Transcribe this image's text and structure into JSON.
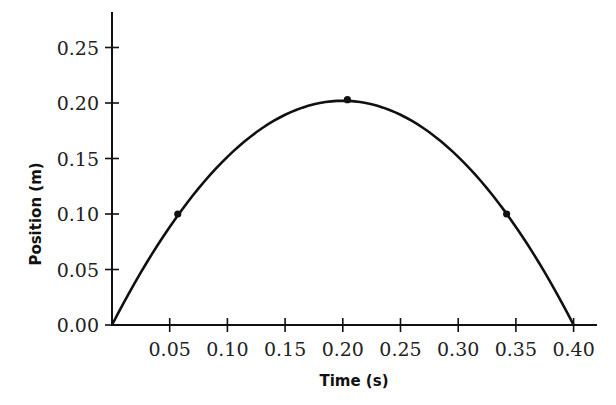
{
  "chart_data": {
    "type": "line",
    "title": "",
    "xlabel": "Time (s)",
    "ylabel": "Position (m)",
    "xlim": [
      0,
      0.42
    ],
    "ylim": [
      0,
      0.28
    ],
    "grid": false,
    "legend": null,
    "x_ticks": [
      "0.05",
      "0.10",
      "0.15",
      "0.20",
      "0.25",
      "0.30",
      "0.35",
      "0.40"
    ],
    "y_ticks": [
      "0.00",
      "0.05",
      "0.10",
      "0.15",
      "0.20",
      "0.25"
    ],
    "series": [
      {
        "name": "position",
        "description": "Parabolic trajectory from (0,0) peaking near (0.20, 0.20) and returning to 0 at t=0.40",
        "x": [
          0,
          0.02,
          0.04,
          0.06,
          0.08,
          0.1,
          0.12,
          0.14,
          0.16,
          0.18,
          0.2,
          0.22,
          0.24,
          0.26,
          0.28,
          0.3,
          0.32,
          0.34,
          0.36,
          0.38,
          0.4
        ],
        "y": [
          0,
          0.039,
          0.073,
          0.102,
          0.13,
          0.152,
          0.171,
          0.185,
          0.195,
          0.2,
          0.202,
          0.2,
          0.195,
          0.185,
          0.171,
          0.152,
          0.13,
          0.102,
          0.073,
          0.039,
          0
        ]
      }
    ],
    "marked_points": [
      {
        "x": 0.057,
        "y": 0.1
      },
      {
        "x": 0.204,
        "y": 0.203
      },
      {
        "x": 0.342,
        "y": 0.1
      }
    ]
  }
}
